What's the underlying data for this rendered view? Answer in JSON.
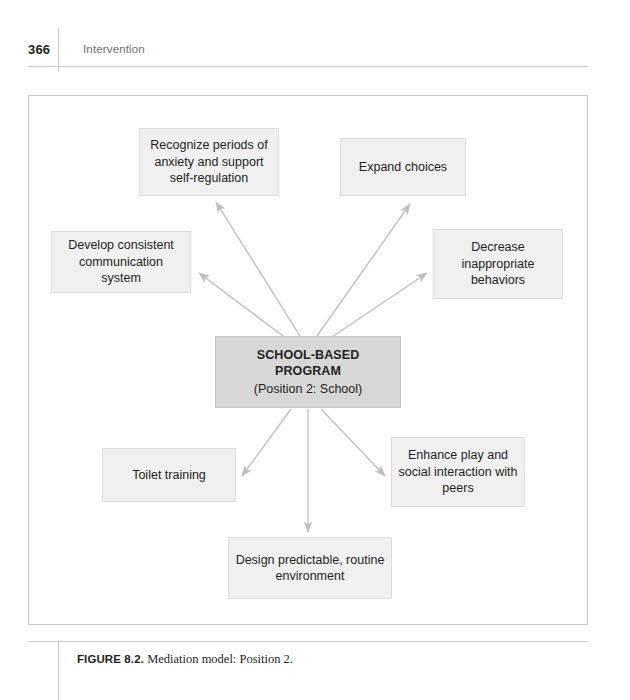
{
  "page": {
    "folio": "366",
    "running_title": "Intervention"
  },
  "figure": {
    "caption_label": "FIGURE 8.2.",
    "caption_text": "Mediation model: Position 2.",
    "colors": {
      "node_fill": "#f0f0f0",
      "node_border": "#dcdcdc",
      "center_fill": "#d7d7d7",
      "center_border": "#c4c4c4",
      "arrow": "#bfbfbf",
      "frame_border": "#c9c9c9",
      "text": "#231f20",
      "running_title": "#6d6e71"
    },
    "center_node": {
      "title": "SCHOOL-BASED PROGRAM",
      "subtitle": "(Position 2:  School)"
    },
    "nodes": [
      {
        "id": "recognize",
        "label": "Recognize periods of anxiety and support self-regulation"
      },
      {
        "id": "expand",
        "label": "Expand choices"
      },
      {
        "id": "develop",
        "label": "Develop consistent communication system"
      },
      {
        "id": "decrease",
        "label": "Decrease inappropriate behaviors"
      },
      {
        "id": "toilet",
        "label": "Toilet training"
      },
      {
        "id": "enhance",
        "label": "Enhance play and social interaction with peers"
      },
      {
        "id": "design",
        "label": "Design predictable, routine environment"
      }
    ],
    "arrows": [
      {
        "from": "center",
        "to": "recognize"
      },
      {
        "from": "center",
        "to": "expand"
      },
      {
        "from": "center",
        "to": "develop"
      },
      {
        "from": "center",
        "to": "decrease"
      },
      {
        "from": "center",
        "to": "toilet"
      },
      {
        "from": "center",
        "to": "enhance"
      },
      {
        "from": "center",
        "to": "design"
      }
    ]
  }
}
